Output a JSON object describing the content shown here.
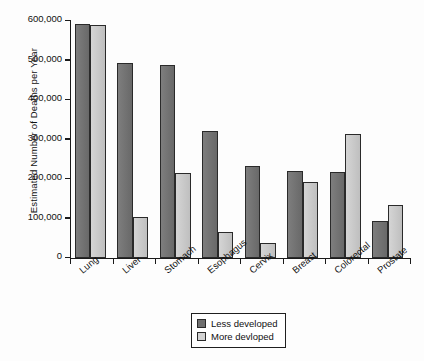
{
  "chart_data": {
    "type": "bar",
    "title": "",
    "xlabel": "",
    "ylabel": "Estimated Number of Deaths per Year",
    "ylim": [
      0,
      600000
    ],
    "yticks": [
      0,
      100000,
      200000,
      300000,
      400000,
      500000,
      600000
    ],
    "ytick_labels": [
      "0",
      "100,000",
      "200,000",
      "300,000",
      "400,000",
      "500,000",
      "600,000"
    ],
    "grid": false,
    "legend_position": "bottom-center",
    "categories": [
      "Lung",
      "Liver",
      "Stomach",
      "Esophagus",
      "Cervix",
      "Breast",
      "Colorectal",
      "Prostate"
    ],
    "series": [
      {
        "name": "Less developed",
        "color": "#6f6f6f",
        "values": [
          592000,
          493000,
          489000,
          321000,
          233000,
          220000,
          218000,
          94000
        ]
      },
      {
        "name": "More devloped",
        "color": "#c9c9c9",
        "values": [
          590000,
          104000,
          215000,
          66000,
          38000,
          192000,
          314000,
          134000
        ]
      }
    ]
  },
  "legend": {
    "items": [
      {
        "label": "Less developed",
        "swatch": "less"
      },
      {
        "label": "More devloped",
        "swatch": "more"
      }
    ]
  }
}
